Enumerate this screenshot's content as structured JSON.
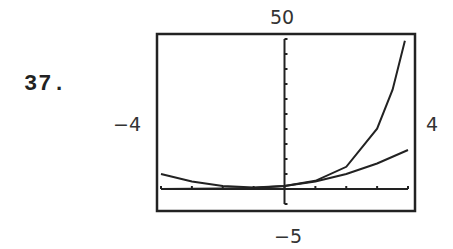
{
  "problem": {
    "number": "37."
  },
  "window": {
    "ymax_label": "50",
    "ymin_label": "−5",
    "xmin_label": "−4",
    "xmax_label": "4"
  },
  "chart_data": {
    "type": "line",
    "title": "",
    "xlabel": "",
    "ylabel": "",
    "xlim": [
      -4,
      4
    ],
    "ylim": [
      -5,
      50
    ],
    "x_tick_step": 1,
    "y_tick_step": 5,
    "grid": false,
    "legend": null,
    "series": [
      {
        "name": "steep curve (exponential-like)",
        "x": [
          -4,
          -3,
          -2,
          -1,
          0,
          1,
          2,
          3,
          3.5,
          3.9
        ],
        "y": [
          0.02,
          0.05,
          0.14,
          0.37,
          1,
          2.72,
          7.39,
          20.09,
          33.1,
          49.4
        ]
      },
      {
        "name": "gentle curve (quadratic-like)",
        "x": [
          -4,
          -3,
          -2,
          -1,
          0,
          1,
          2,
          3,
          4
        ],
        "y": [
          5,
          2.5,
          1,
          0.5,
          1,
          2.5,
          5,
          8.5,
          13
        ]
      }
    ]
  },
  "colors": {
    "ink": "#222222",
    "background": "#ffffff"
  }
}
